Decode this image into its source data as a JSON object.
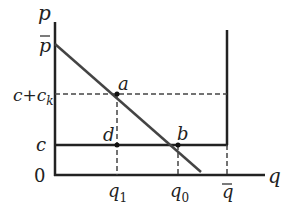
{
  "diagram": {
    "type": "economics price-quantity diagram",
    "axes": {
      "y_label": "p",
      "x_label": "q",
      "origin_label": "0"
    },
    "y_ticks": {
      "p_bar": "p",
      "c_plus_ck": "c+c",
      "ck_subscript": "k",
      "c": "c"
    },
    "x_ticks": {
      "q1": "q",
      "q1_sub": "1",
      "q0": "q",
      "q0_sub": "0",
      "q_bar": "q"
    },
    "points": {
      "a": "a",
      "b": "b",
      "d": "d"
    },
    "colors": {
      "line": "#222222",
      "demand": "#444444"
    }
  }
}
